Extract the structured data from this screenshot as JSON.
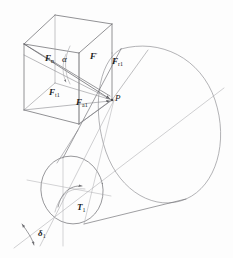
{
  "figure": {
    "domain": "technical-diagram",
    "stroke_color": "#6e6e72",
    "stroke_color_dark": "#4a4a4e",
    "background": "#fdfdfd",
    "label_color": "#1a1a1a"
  },
  "labels": {
    "f_n": {
      "symbol": "F",
      "sub": "n",
      "text": "Fn"
    },
    "alpha": {
      "symbol": "α",
      "text": "α"
    },
    "f_prime": {
      "symbol": "F",
      "sub": "′",
      "text": "F′"
    },
    "f_r1": {
      "symbol": "F",
      "sub": "r1",
      "text": "Fr1"
    },
    "f_t1": {
      "symbol": "F",
      "sub": "t1",
      "text": "Ft1"
    },
    "f_a1": {
      "symbol": "F",
      "sub": "a1",
      "text": "Fa1"
    },
    "point_p": {
      "symbol": "P",
      "text": "P"
    },
    "t_1": {
      "symbol": "T",
      "sub": "1",
      "text": "T1"
    },
    "delta_1": {
      "symbol": "δ",
      "sub": "1",
      "text": "δ1"
    }
  },
  "label_parts": {
    "F": "F",
    "P": "P",
    "T": "T",
    "alpha": "α",
    "delta": "δ",
    "n": "n",
    "prime": "′",
    "r1": "r1",
    "t1": "t1",
    "a1": "a1",
    "one": "1"
  },
  "elements": {
    "force_cube": "force-parallelepiped",
    "pitch_cone": "pitch-cone-body",
    "front_circle": "small-end-pitch-circle",
    "back_ellipse": "large-end-pitch-circle",
    "cone_axis": "cone-axis-line",
    "pitch_line": "pitch-cone-generator-line",
    "torque_arc": "torque-direction-arrow",
    "alpha_arc": "pressure-angle-arc",
    "delta_arc": "pitch-cone-angle-arc"
  }
}
